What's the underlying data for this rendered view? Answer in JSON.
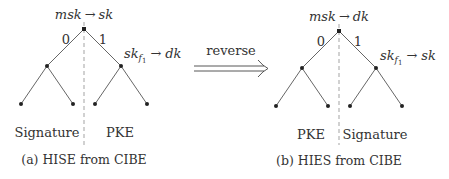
{
  "figures": [
    {
      "id": "a",
      "root_label": "msk → sk",
      "root_label_parts": {
        "lhs": "msk",
        "arrow": "→",
        "rhs": "sk"
      },
      "edge_left_label": "0",
      "edge_right_label": "1",
      "right_node_label": {
        "base": "sk",
        "sub": "f",
        "subsub": "1",
        "arrow": "→",
        "rhs": "dk"
      },
      "left_region_label": "Signature",
      "right_region_label": "PKE",
      "caption": "(a) HISE from CIBE"
    },
    {
      "id": "b",
      "root_label": "msk → dk",
      "root_label_parts": {
        "lhs": "msk",
        "arrow": "→",
        "rhs": "dk"
      },
      "edge_left_label": "0",
      "edge_right_label": "1",
      "right_node_label": {
        "base": "sk",
        "sub": "f",
        "subsub": "1",
        "arrow": "→",
        "rhs": "sk"
      },
      "left_region_label": "PKE",
      "right_region_label": "Signature",
      "caption": "(b) HIES from CIBE"
    }
  ],
  "transform": {
    "label": "reverse",
    "icon": "double-arrow-right-icon"
  }
}
